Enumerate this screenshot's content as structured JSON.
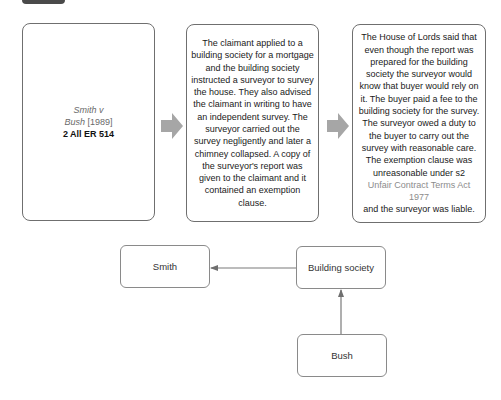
{
  "case_box": {
    "name": "Smith v",
    "name_line2": "Bush",
    "year": "[1989]",
    "reference": "2 All ER 514"
  },
  "facts_box": {
    "text": "The claimant applied to a building society for a mortgage and the building society instructed a surveyor to survey the house. They also advised the claimant in writing to have an independent survey. The surveyor carried out the survey negligently and later a chimney collapsed. A copy of the surveyor's report was given to the claimant and it contained an exemption clause."
  },
  "held_box": {
    "text": "The House of Lords said that even though the report was prepared for the building society the surveyor would know that buyer would rely on it. The buyer paid a fee to the building society for the survey. The surveyor owed a duty to the buyer to carry out the survey with reasonable care.",
    "text2": "The exemption clause was unreasonable under s2",
    "statute": "Unfair Contract Terms Act 1977",
    "text3": "and the surveyor was liable."
  },
  "arrows": {
    "icon": "arrow-right-icon",
    "color": "#a6a6a6"
  },
  "relationship_diagram": {
    "nodes": [
      {
        "id": "smith",
        "label": "Smith"
      },
      {
        "id": "building_society",
        "label": "Building society"
      },
      {
        "id": "bush",
        "label": "Bush"
      }
    ],
    "edges": [
      {
        "from": "building_society",
        "to": "smith"
      },
      {
        "from": "bush",
        "to": "building_society"
      }
    ]
  },
  "colors": {
    "border": "#6f6f6f",
    "muted_text": "#6b6b6b",
    "statute_text": "#8c8c8c",
    "tab": "#4a4a4a"
  }
}
